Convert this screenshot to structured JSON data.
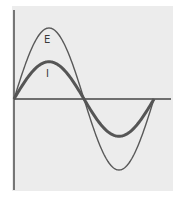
{
  "diagram": {
    "title": "",
    "labels": {
      "voltage": "E",
      "current": "I"
    },
    "colors": {
      "background": "#ececec",
      "axis": "#444444",
      "voltage_curve": "#555555",
      "current_curve": "#555555"
    }
  },
  "chart_data": {
    "type": "line",
    "title": "",
    "xlabel": "",
    "ylabel": "",
    "grid": false,
    "legend": "inline labels",
    "x": [
      0,
      45,
      90,
      135,
      180,
      225,
      270,
      315,
      360
    ],
    "series": [
      {
        "name": "E",
        "values": [
          0,
          0.707,
          1.0,
          0.707,
          0,
          -0.707,
          -1.0,
          -0.707,
          0
        ]
      },
      {
        "name": "I",
        "values": [
          0,
          0.371,
          0.525,
          0.371,
          0,
          -0.371,
          -0.525,
          -0.371,
          0
        ]
      }
    ]
  }
}
